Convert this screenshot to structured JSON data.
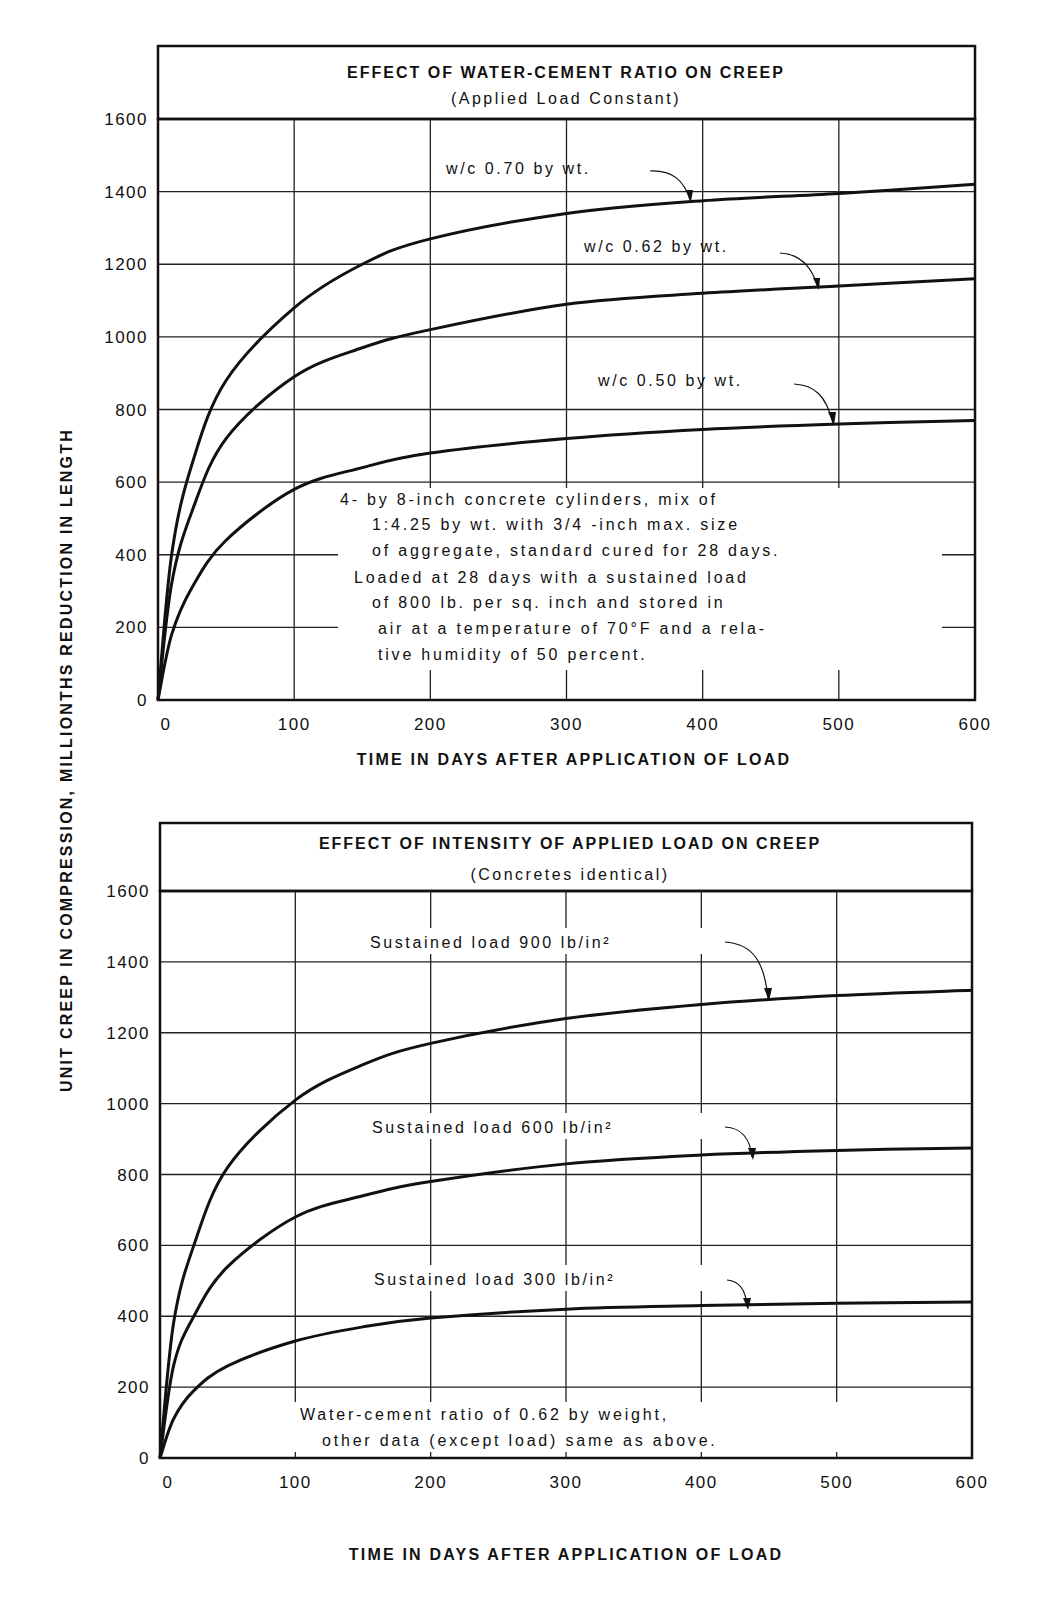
{
  "figure": {
    "y_axis_label": "UNIT CREEP IN COMPRESSION, MILLIONTHS REDUCTION IN LENGTH",
    "top": {
      "title": "EFFECT OF WATER-CEMENT RATIO ON CREEP",
      "subtitle": "(Applied Load Constant)",
      "x_axis_label": "TIME IN DAYS AFTER APPLICATION OF LOAD",
      "x_ticks": [
        "0",
        "100",
        "200",
        "300",
        "400",
        "500",
        "600"
      ],
      "y_ticks": [
        "0",
        "200",
        "400",
        "600",
        "800",
        "1000",
        "1200",
        "1400",
        "1600"
      ],
      "labels": [
        "w/c 0.70 by wt.",
        "w/c 0.62 by wt.",
        "w/c 0.50 by wt."
      ],
      "note": [
        "4- by 8-inch concrete cylinders, mix of",
        "1:4.25 by wt. with 3/4 -inch max. size",
        "of aggregate, standard cured for 28 days.",
        "Loaded at 28 days with a sustained load",
        "of 800 lb. per sq. inch and stored in",
        "air at a temperature of 70°F and a rela-",
        "tive humidity of 50 percent."
      ]
    },
    "bottom": {
      "title": "EFFECT OF INTENSITY OF APPLIED LOAD ON CREEP",
      "subtitle": "(Concretes identical)",
      "x_axis_label": "TIME IN DAYS AFTER APPLICATION OF LOAD",
      "x_ticks": [
        "0",
        "100",
        "200",
        "300",
        "400",
        "500",
        "600"
      ],
      "y_ticks": [
        "0",
        "200",
        "400",
        "600",
        "800",
        "1000",
        "1200",
        "1400",
        "1600"
      ],
      "labels": [
        "Sustained load 900 lb/in²",
        "Sustained load 600 lb/in²",
        "Sustained load 300 lb/in²"
      ],
      "note": [
        "Water-cement ratio of 0.62 by weight,",
        "other data (except load) same as above."
      ]
    }
  },
  "chart_data": [
    {
      "type": "line",
      "title": "EFFECT OF WATER-CEMENT RATIO ON CREEP",
      "subtitle": "(Applied Load Constant)",
      "xlabel": "TIME IN DAYS AFTER APPLICATION OF LOAD",
      "ylabel": "UNIT CREEP IN COMPRESSION, MILLIONTHS REDUCTION IN LENGTH",
      "xlim": [
        0,
        600
      ],
      "ylim": [
        0,
        1600
      ],
      "grid": true,
      "x": [
        0,
        10,
        25,
        50,
        100,
        150,
        200,
        300,
        400,
        500,
        600
      ],
      "series": [
        {
          "name": "w/c 0.70 by wt.",
          "values": [
            0,
            400,
            650,
            880,
            1080,
            1200,
            1270,
            1340,
            1375,
            1395,
            1420
          ]
        },
        {
          "name": "w/c 0.62 by wt.",
          "values": [
            0,
            320,
            520,
            720,
            890,
            970,
            1020,
            1090,
            1120,
            1140,
            1160
          ]
        },
        {
          "name": "w/c 0.50 by wt.",
          "values": [
            0,
            180,
            310,
            440,
            580,
            640,
            680,
            720,
            745,
            760,
            770
          ]
        }
      ],
      "annotations": [
        "4- by 8-inch concrete cylinders, mix of 1:4.25 by wt. with 3/4-inch max. size of aggregate, standard cured for 28 days. Loaded at 28 days with a sustained load of 800 lb. per sq. inch and stored in air at a temperature of 70°F and a relative humidity of 50 percent."
      ]
    },
    {
      "type": "line",
      "title": "EFFECT OF INTENSITY OF APPLIED LOAD ON CREEP",
      "subtitle": "(Concretes identical)",
      "xlabel": "TIME IN DAYS AFTER APPLICATION OF LOAD",
      "ylabel": "UNIT CREEP IN COMPRESSION, MILLIONTHS REDUCTION IN LENGTH",
      "xlim": [
        0,
        600
      ],
      "ylim": [
        0,
        1600
      ],
      "grid": true,
      "x": [
        0,
        10,
        25,
        50,
        100,
        150,
        200,
        300,
        400,
        500,
        600
      ],
      "series": [
        {
          "name": "Sustained load 900 lb/in²",
          "values": [
            0,
            380,
            600,
            820,
            1010,
            1110,
            1170,
            1240,
            1280,
            1305,
            1320
          ]
        },
        {
          "name": "Sustained load 600 lb/in²",
          "values": [
            0,
            260,
            400,
            540,
            680,
            740,
            780,
            830,
            855,
            868,
            875
          ]
        },
        {
          "name": "Sustained load 300 lb/in²",
          "values": [
            0,
            110,
            190,
            260,
            330,
            370,
            395,
            420,
            430,
            437,
            440
          ]
        }
      ],
      "annotations": [
        "Water-cement ratio of 0.62 by weight, other data (except load) same as above."
      ]
    }
  ]
}
